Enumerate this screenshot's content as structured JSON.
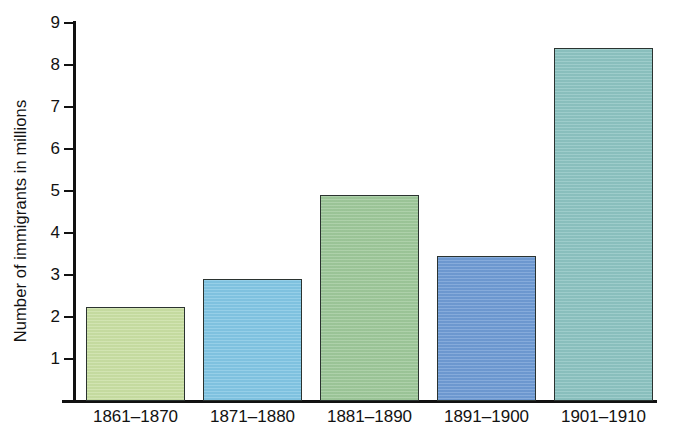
{
  "chart_data": {
    "type": "bar",
    "title": "",
    "xlabel": "",
    "ylabel": "Number of immigrants in millions",
    "categories": [
      "1861–1870",
      "1871–1880",
      "1881–1890",
      "1891–1900",
      "1901–1910"
    ],
    "values": [
      2.25,
      2.9,
      4.9,
      3.45,
      8.4
    ],
    "ylim": [
      0,
      9
    ],
    "yticks": [
      1,
      2,
      3,
      4,
      5,
      6,
      7,
      8,
      9
    ],
    "ytick_labels": [
      "1",
      "2",
      "3",
      "4",
      "5",
      "6",
      "7",
      "8",
      "9"
    ],
    "grid": false,
    "legend": false,
    "bar_colors": [
      "#c9dfa3",
      "#82c6e4",
      "#9ec89a",
      "#6f9bd4",
      "#8cc3c1"
    ],
    "bar_edge_color": "#2b3330",
    "axis_color": "#111111",
    "background_color": "#ffffff"
  }
}
